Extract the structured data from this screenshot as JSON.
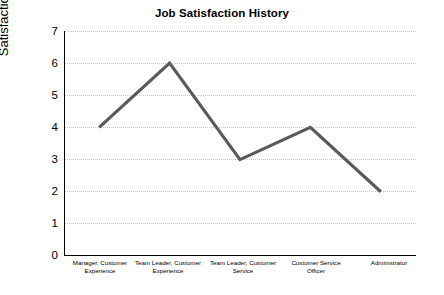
{
  "chart_data": {
    "type": "line",
    "title": "Job Satisfaction History",
    "xlabel": "",
    "ylabel": "Satisfaction Rating",
    "categories": [
      "Manager, Customer Experience",
      "Team Leader, Customer Experience",
      "Team Leader, Customer Service",
      "Customer Service Officer",
      "Administrator"
    ],
    "values": [
      4,
      6,
      3,
      4,
      2
    ],
    "ylim": [
      0,
      7
    ],
    "yticks": [
      0,
      1,
      2,
      3,
      4,
      5,
      6,
      7
    ],
    "grid": "horizontal-dotted",
    "legend": "none",
    "series": [
      {
        "name": "Satisfaction Rating",
        "values": [
          4,
          6,
          3,
          4,
          2
        ],
        "color": "#5a5a5a"
      }
    ]
  },
  "axis": {
    "y_tick_labels": [
      "7",
      "6",
      "5",
      "4",
      "3",
      "2",
      "1",
      "0"
    ],
    "x_tick_labels": [
      [
        "Manager, Customer",
        "Experience"
      ],
      [
        "Team Leader, Customer",
        "Experience"
      ],
      [
        "Team Leader, Customer",
        "Service"
      ],
      [
        "Customer Service",
        "Officer"
      ],
      [
        "Administrator"
      ]
    ]
  }
}
